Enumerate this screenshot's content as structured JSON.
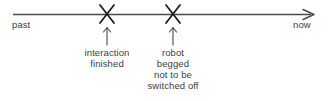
{
  "diagram": {
    "type": "timeline",
    "axis": {
      "left_label": "past",
      "right_label": "now",
      "arrow_direction": "right",
      "line_color": "#4a4a4a",
      "text_color": "#3d3d3d",
      "background_color": "#ffffff"
    },
    "events": [
      {
        "marker": "x-marker",
        "position_fraction": 0.31,
        "connector": "up-arrow",
        "label_lines": [
          "interaction",
          "finished"
        ]
      },
      {
        "marker": "x-marker",
        "position_fraction": 0.54,
        "connector": "up-arrow",
        "label_lines": [
          "robot",
          "begged",
          "not to be",
          "switched off"
        ]
      }
    ]
  }
}
